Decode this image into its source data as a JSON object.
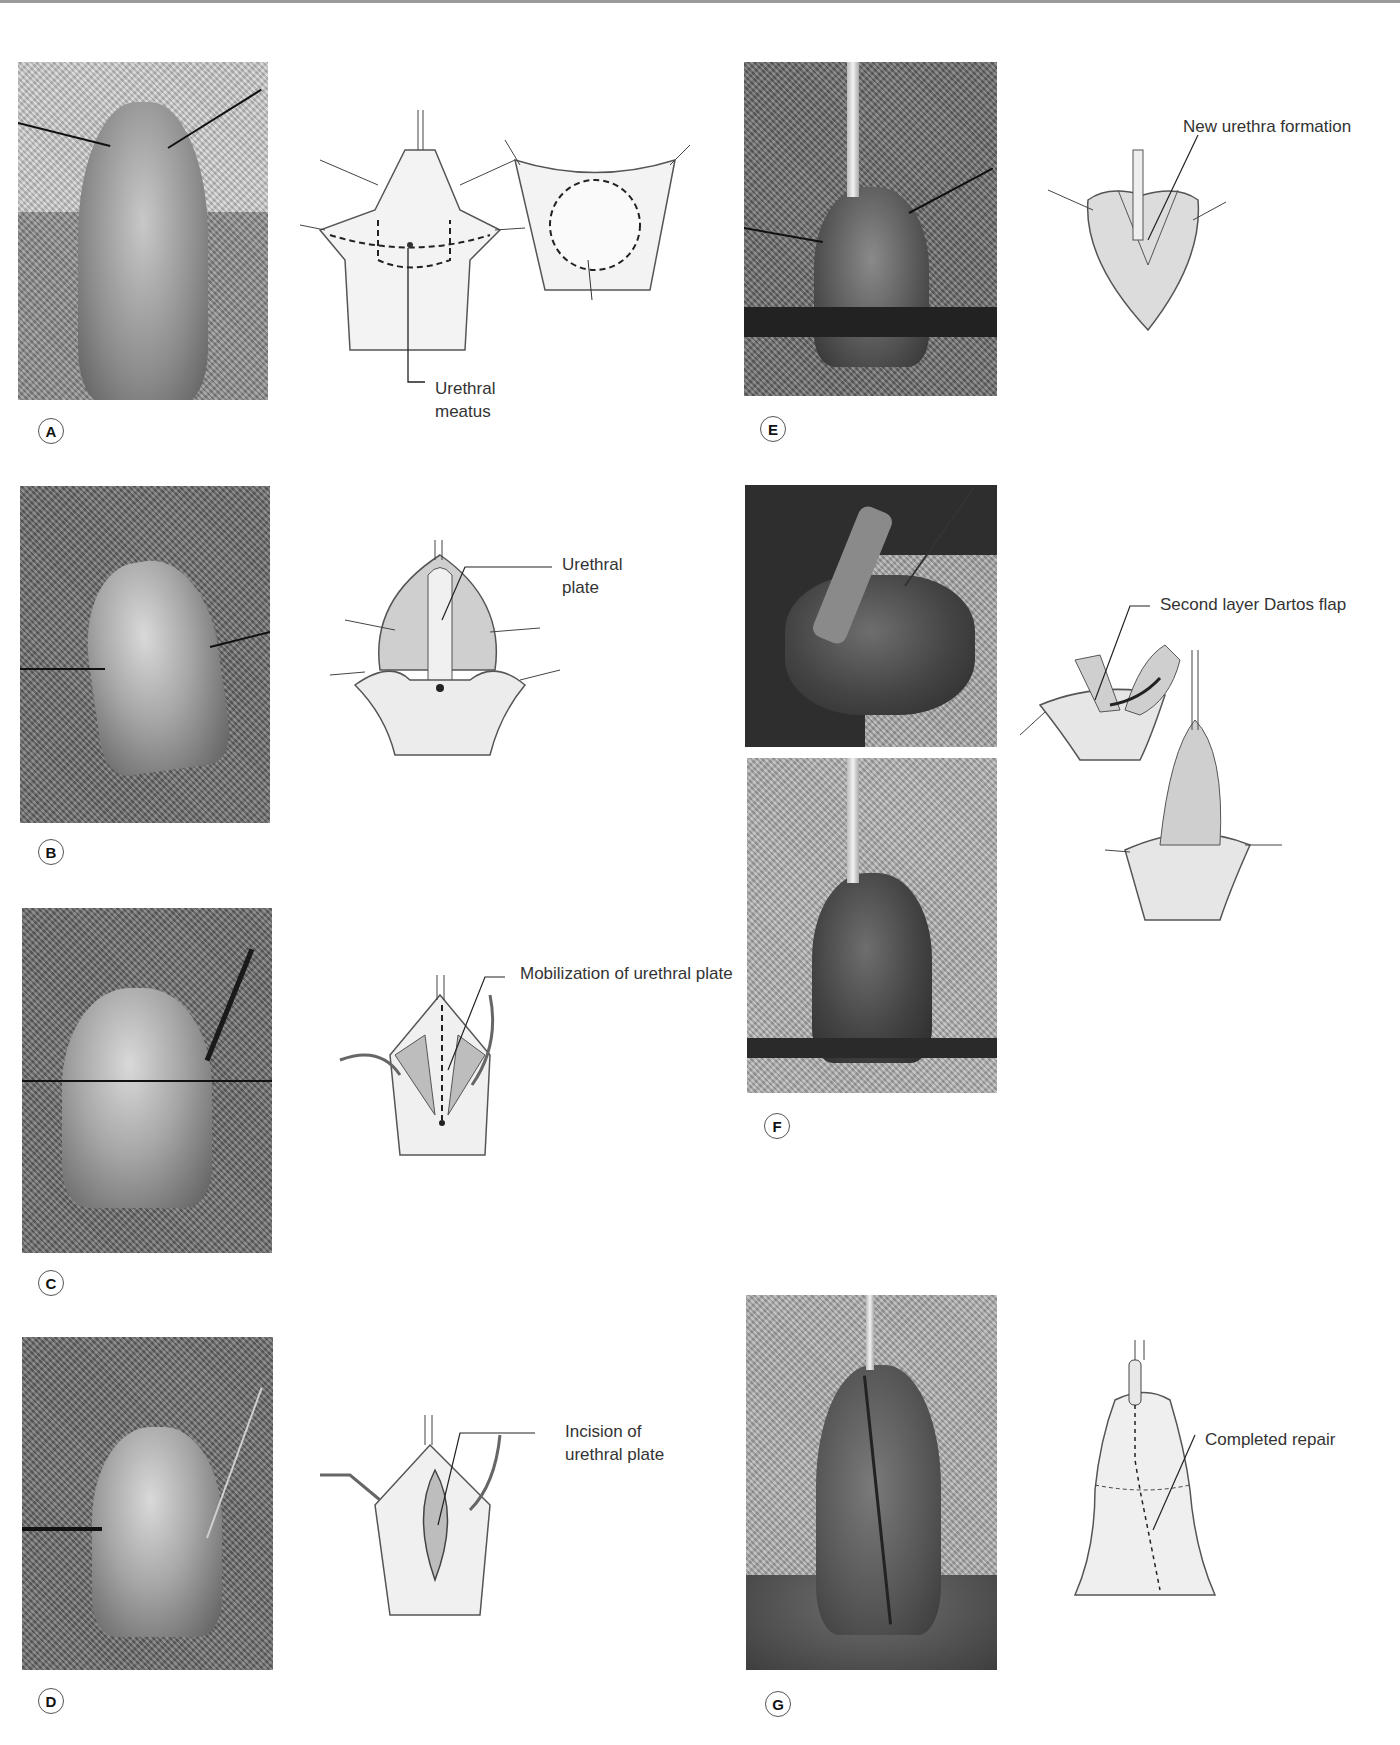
{
  "figure": {
    "panels": [
      {
        "id": "A",
        "label": "A",
        "callout": [
          "Urethral",
          "meatus"
        ]
      },
      {
        "id": "B",
        "label": "B",
        "callout": [
          "Urethral",
          "plate"
        ]
      },
      {
        "id": "C",
        "label": "C",
        "callout": [
          "Mobilization of urethral plate"
        ]
      },
      {
        "id": "D",
        "label": "D",
        "callout": [
          "Incision of",
          "urethral plate"
        ]
      },
      {
        "id": "E",
        "label": "E",
        "callout": [
          "New urethra formation"
        ]
      },
      {
        "id": "F",
        "label": "F",
        "callout": [
          "Second layer Dartos flap"
        ]
      },
      {
        "id": "G",
        "label": "G",
        "callout": [
          "Completed repair"
        ]
      }
    ]
  }
}
